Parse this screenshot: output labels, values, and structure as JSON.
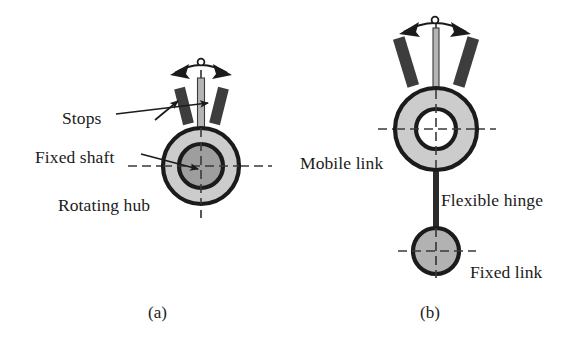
{
  "figure": {
    "background_color": "#ffffff",
    "ink_color": "#1b1b1b",
    "fill_light_gray": "#cccccc",
    "fill_mid_gray": "#a8a8a8",
    "fill_dark_gray": "#3d3d3d",
    "fill_white": "#ffffff",
    "panels": [
      {
        "id": "panel-a",
        "caption": "(a)",
        "caption_x": 148,
        "caption_y": 318,
        "labels": [
          {
            "key": "stops",
            "text": "Stops",
            "x": 62,
            "y": 118,
            "anchor": "start"
          },
          {
            "key": "fixed_shaft",
            "text": "Fixed shaft",
            "x": 35,
            "y": 160,
            "anchor": "start"
          },
          {
            "key": "rotating_hub",
            "text": "Rotating hub",
            "x": 58,
            "y": 210,
            "anchor": "start"
          }
        ],
        "hub": {
          "center_x": 201,
          "center_y": 166,
          "outer_radius": 38,
          "outer_stroke": 4.2,
          "mid_radius": 22,
          "mid_stroke": 4.2,
          "annulus_fill": "#cccccc",
          "core_fill": "#9e9e9e"
        },
        "shaft": {
          "x": 201,
          "top_y": 78,
          "bottom_y": 166,
          "width": 7,
          "fill": "#b5b5b5"
        },
        "stops_blocks": [
          {
            "side": "left",
            "cx": 184,
            "cy": 106,
            "w": 11,
            "h": 37,
            "rotate": -14
          },
          {
            "side": "right",
            "cx": 219,
            "cy": 106,
            "w": 11,
            "h": 37,
            "rotate": 14
          }
        ],
        "swing_arrow": {
          "apex_x": 201,
          "apex_y": 62,
          "left_tip_x": 170,
          "left_tip_y": 75,
          "right_tip_x": 232,
          "right_tip_y": 75,
          "hub_marker_radius": 3.4
        },
        "center_lines": {
          "horizontal_x1": 128,
          "horizontal_x2": 272,
          "horizontal_y": 166,
          "vertical_y1": 70,
          "vertical_y2": 218,
          "vertical_x": 201,
          "dash": "9,5"
        },
        "leaders": [
          {
            "key": "stops-leader",
            "x1": 116,
            "y1": 114,
            "x2": 213,
            "y2": 102,
            "arrow": true
          },
          {
            "key": "stops-leader-2",
            "x1": 152,
            "y1": 118,
            "x2": 177,
            "y2": 100,
            "arrow": true
          },
          {
            "key": "fixed-shaft-leader",
            "x1": 141,
            "y1": 155,
            "x2": 201,
            "y2": 169,
            "arrow": true
          }
        ]
      },
      {
        "id": "panel-b",
        "caption": "(b)",
        "caption_x": 420,
        "caption_y": 318,
        "labels": [
          {
            "key": "mobile_link",
            "text": "Mobile link",
            "x": 300,
            "y": 168,
            "anchor": "start"
          },
          {
            "key": "flexible_hinge",
            "text": "Flexible hinge",
            "x": 441,
            "y": 205,
            "anchor": "start"
          },
          {
            "key": "fixed_link",
            "text": "Fixed link",
            "x": 470,
            "y": 277,
            "anchor": "start"
          }
        ],
        "ring": {
          "center_x": 436,
          "center_y": 129,
          "outer_radius": 41,
          "inner_radius": 20,
          "stroke": 4.2,
          "annulus_fill": "#cccccc",
          "hole_fill": "#ffffff"
        },
        "hinge": {
          "x": 436,
          "top_y": 165,
          "bottom_y": 234,
          "width": 6,
          "fill": "#2b2b2b"
        },
        "fixed_link_circle": {
          "center_x": 436,
          "center_y": 251,
          "radius": 23,
          "stroke": 4.2,
          "fill": "#b2b2b2"
        },
        "shaft": {
          "x": 436,
          "top_y": 28,
          "bottom_y": 92,
          "width": 6,
          "fill": "#b5b5b5"
        },
        "stops_blocks": [
          {
            "side": "left",
            "cx": 406,
            "cy": 62,
            "w": 12,
            "h": 50,
            "rotate": -17
          },
          {
            "side": "right",
            "cx": 466,
            "cy": 62,
            "w": 12,
            "h": 50,
            "rotate": 17
          }
        ],
        "swing_arrow": {
          "apex_x": 435,
          "apex_y": 20,
          "left_tip_x": 399,
          "left_tip_y": 34,
          "right_tip_x": 471,
          "right_tip_y": 34,
          "hub_marker_radius": 3.4
        },
        "center_lines": {
          "ring_horizontal_x1": 378,
          "ring_horizontal_x2": 496,
          "ring_horizontal_y": 129,
          "ring_vertical_y1": 24,
          "ring_vertical_y2": 178,
          "ring_vertical_x": 436,
          "link_horizontal_x1": 398,
          "link_horizontal_x2": 476,
          "link_horizontal_y": 251,
          "link_vertical_y1": 228,
          "link_vertical_y2": 278,
          "link_vertical_x": 436,
          "dash": "9,5"
        }
      }
    ]
  }
}
